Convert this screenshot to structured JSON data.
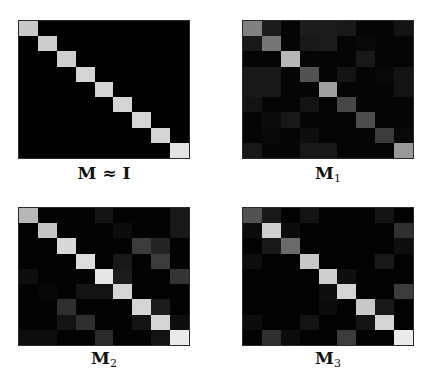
{
  "chart_data": [
    {
      "type": "heatmap",
      "title": "M ≈ I",
      "label_main": "M ≈ I",
      "label_sub": "",
      "rows": 9,
      "cols": 9,
      "colormap": "grayscale (black = 0, white = 1)",
      "values": [
        [
          0.85,
          0,
          0,
          0,
          0,
          0,
          0,
          0,
          0
        ],
        [
          0,
          0.87,
          0,
          0,
          0,
          0,
          0,
          0,
          0
        ],
        [
          0,
          0,
          0.88,
          0,
          0,
          0,
          0,
          0,
          0
        ],
        [
          0,
          0,
          0,
          0.9,
          0,
          0,
          0,
          0,
          0
        ],
        [
          0,
          0,
          0,
          0,
          0.9,
          0,
          0,
          0,
          0
        ],
        [
          0,
          0,
          0,
          0,
          0,
          0.9,
          0,
          0,
          0
        ],
        [
          0,
          0,
          0,
          0,
          0,
          0,
          0.9,
          0,
          0
        ],
        [
          0,
          0,
          0,
          0,
          0,
          0,
          0,
          0.9,
          0
        ],
        [
          0,
          0,
          0,
          0,
          0,
          0,
          0,
          0,
          0.97
        ]
      ]
    },
    {
      "type": "heatmap",
      "title": "M1",
      "label_main": "M",
      "label_sub": "1",
      "rows": 9,
      "cols": 9,
      "colormap": "grayscale (black = 0, white = 1)",
      "values": [
        [
          0.55,
          0.12,
          0.02,
          0.12,
          0.12,
          0.1,
          0.02,
          0.02,
          0.08
        ],
        [
          0.1,
          0.5,
          0.02,
          0.1,
          0.12,
          0.02,
          0.04,
          0.02,
          0.02
        ],
        [
          0.02,
          0.02,
          0.78,
          0.02,
          0.02,
          0.02,
          0.1,
          0.02,
          0.02
        ],
        [
          0.1,
          0.1,
          0.02,
          0.35,
          0.02,
          0.08,
          0.02,
          0.04,
          0.08
        ],
        [
          0.1,
          0.1,
          0.02,
          0.02,
          0.68,
          0.02,
          0.02,
          0.02,
          0.08
        ],
        [
          0.08,
          0.02,
          0.02,
          0.08,
          0.02,
          0.3,
          0.02,
          0.02,
          0.02
        ],
        [
          0.02,
          0.05,
          0.1,
          0.02,
          0.02,
          0.02,
          0.33,
          0.02,
          0.02
        ],
        [
          0.02,
          0.04,
          0.02,
          0.06,
          0.02,
          0.02,
          0.02,
          0.25,
          0.04
        ],
        [
          0.1,
          0.02,
          0.02,
          0.1,
          0.1,
          0.02,
          0.02,
          0.02,
          0.65
        ]
      ]
    },
    {
      "type": "heatmap",
      "title": "M2",
      "label_main": "M",
      "label_sub": "2",
      "rows": 9,
      "cols": 9,
      "colormap": "grayscale (black = 0, white = 1)",
      "values": [
        [
          0.78,
          0.01,
          0.01,
          0.01,
          0.08,
          0.01,
          0.01,
          0.01,
          0.1
        ],
        [
          0.01,
          0.83,
          0.01,
          0.01,
          0.01,
          0.05,
          0.01,
          0.01,
          0.1
        ],
        [
          0.01,
          0.01,
          0.92,
          0.01,
          0.01,
          0.01,
          0.25,
          0.15,
          0.01
        ],
        [
          0.01,
          0.01,
          0.01,
          0.94,
          0.01,
          0.1,
          0.01,
          0.25,
          0.01
        ],
        [
          0.06,
          0.01,
          0.01,
          0.01,
          0.98,
          0.12,
          0.01,
          0.01,
          0.22
        ],
        [
          0.01,
          0.03,
          0.01,
          0.08,
          0.08,
          0.9,
          0.01,
          0.01,
          0.01
        ],
        [
          0.01,
          0.01,
          0.2,
          0.01,
          0.01,
          0.01,
          0.9,
          0.12,
          0.01
        ],
        [
          0.01,
          0.01,
          0.08,
          0.2,
          0.01,
          0.01,
          0.08,
          0.9,
          0.06
        ],
        [
          0.06,
          0.06,
          0.01,
          0.01,
          0.18,
          0.01,
          0.01,
          0.08,
          1.0
        ]
      ]
    },
    {
      "type": "heatmap",
      "title": "M3",
      "label_main": "M",
      "label_sub": "3",
      "rows": 9,
      "cols": 9,
      "colormap": "grayscale (black = 0, white = 1)",
      "values": [
        [
          0.35,
          0.1,
          0.01,
          0.08,
          0.01,
          0.01,
          0.01,
          0.08,
          0.01
        ],
        [
          0.05,
          0.88,
          0.05,
          0.01,
          0.01,
          0.01,
          0.01,
          0.01,
          0.2
        ],
        [
          0.01,
          0.1,
          0.45,
          0.01,
          0.01,
          0.01,
          0.01,
          0.01,
          0.06
        ],
        [
          0.06,
          0.01,
          0.01,
          0.85,
          0.01,
          0.01,
          0.01,
          0.1,
          0.01
        ],
        [
          0.01,
          0.01,
          0.01,
          0.01,
          0.88,
          0.06,
          0.01,
          0.01,
          0.01
        ],
        [
          0.01,
          0.01,
          0.01,
          0.01,
          0.06,
          0.9,
          0.01,
          0.01,
          0.25
        ],
        [
          0.01,
          0.01,
          0.01,
          0.01,
          0.05,
          0.01,
          0.85,
          0.1,
          0.01
        ],
        [
          0.05,
          0.01,
          0.01,
          0.08,
          0.01,
          0.01,
          0.08,
          0.9,
          0.01
        ],
        [
          0.01,
          0.2,
          0.05,
          0.01,
          0.01,
          0.25,
          0.01,
          0.01,
          1.0
        ]
      ]
    }
  ],
  "figure": {
    "panels": [
      {
        "id": "identity",
        "label_main": "M ≈ I",
        "label_sub": ""
      },
      {
        "id": "m1",
        "label_main": "M",
        "label_sub": "1"
      },
      {
        "id": "m2",
        "label_main": "M",
        "label_sub": "2"
      },
      {
        "id": "m3",
        "label_main": "M",
        "label_sub": "3"
      }
    ]
  }
}
